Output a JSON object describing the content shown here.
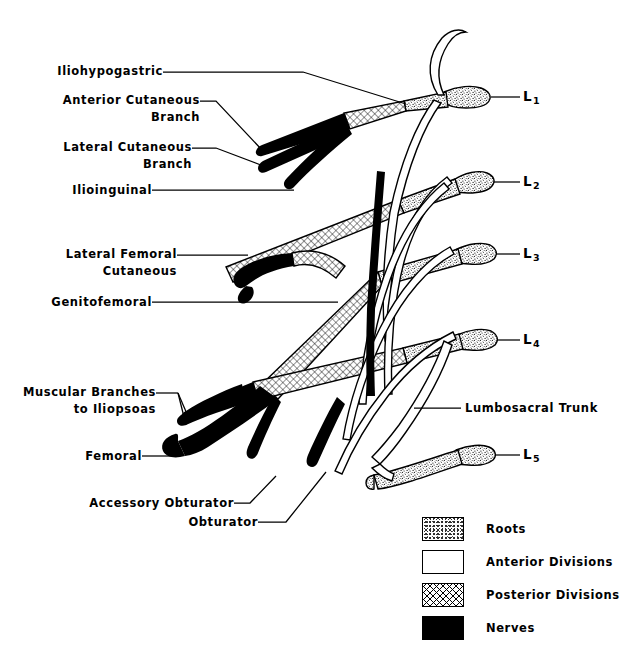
{
  "figure": {
    "background_color": "#ffffff",
    "ink_color": "#000000"
  },
  "left_labels": [
    {
      "id": "iliohypogastric",
      "lines": [
        "Iliohypogastric"
      ]
    },
    {
      "id": "anterior-cutaneous",
      "lines": [
        "Anterior  Cutaneous",
        "Branch"
      ]
    },
    {
      "id": "lateral-cutaneous",
      "lines": [
        "Lateral  Cutaneous",
        "Branch"
      ]
    },
    {
      "id": "ilioinguinal",
      "lines": [
        "Ilioinguinal"
      ]
    },
    {
      "id": "lateral-femoral-cutaneous",
      "lines": [
        "Lateral  Femoral",
        "Cutaneous"
      ]
    },
    {
      "id": "genitofemoral",
      "lines": [
        "Genitofemoral"
      ]
    },
    {
      "id": "muscular-branches",
      "lines": [
        "Muscular  Branches",
        "to  Iliopsoas"
      ]
    },
    {
      "id": "femoral",
      "lines": [
        "Femoral"
      ]
    },
    {
      "id": "accessory-obturator",
      "lines": [
        "Accessory  Obturator"
      ]
    },
    {
      "id": "obturator",
      "lines": [
        "Obturator"
      ]
    }
  ],
  "right_labels": [
    {
      "id": "l1",
      "letter": "L",
      "subscript": "1"
    },
    {
      "id": "l2",
      "letter": "L",
      "subscript": "2"
    },
    {
      "id": "l3",
      "letter": "L",
      "subscript": "3"
    },
    {
      "id": "lumbosacral-trunk",
      "text": "Lumbosacral  Trunk"
    },
    {
      "id": "l4",
      "letter": "L",
      "subscript": "4"
    },
    {
      "id": "l5",
      "letter": "L",
      "subscript": "5"
    }
  ],
  "legend": {
    "items": [
      {
        "id": "roots",
        "label": "Roots",
        "pattern": "stipple",
        "color": "#ffffff"
      },
      {
        "id": "anterior-divisions",
        "label": "Anterior  Divisions",
        "pattern": "plain",
        "color": "#ffffff"
      },
      {
        "id": "posterior-divisions",
        "label": "Posterior  Divisions",
        "pattern": "cross-hatch",
        "color": "#ffffff"
      },
      {
        "id": "nerves",
        "label": "Nerves",
        "pattern": "solid",
        "color": "#000000"
      }
    ]
  }
}
